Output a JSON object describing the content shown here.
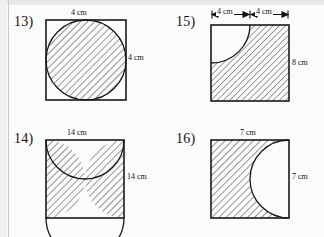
{
  "page": {
    "background_color": "#fbfbfb",
    "line_color": "#1a1a1a",
    "margin_rule_color": "#c9c9c9"
  },
  "problems": [
    {
      "number": "13)",
      "shape": "square-with-four-corner-quarter-circles",
      "shaded_region": "central-astroid-star",
      "labels": {
        "top": "4 cm",
        "right": "4 cm"
      },
      "dimension_style": "plain",
      "side_cm": 4,
      "radius_cm": 2
    },
    {
      "number": "15)",
      "shape": "square-with-quarter-circle-cut-from-top-left",
      "shaded_region": "square-minus-quarter-circle",
      "labels": {
        "top_left_segment": "4 cm",
        "top_right_segment": "4 cm",
        "right": "8 cm"
      },
      "dimension_style": "arrows",
      "side_cm": 8,
      "radius_cm": 4
    },
    {
      "number": "14)",
      "shape": "square-with-two-semicircles-top-and-bottom",
      "shaded_region": "left-and-right-side-slivers",
      "labels": {
        "top": "14 cm",
        "right": "14 cm"
      },
      "dimension_style": "plain",
      "side_cm": 14,
      "radius_cm": 7
    },
    {
      "number": "16)",
      "shape": "square-with-semicircle-cut-from-right-edge",
      "shaded_region": "square-minus-semicircle",
      "labels": {
        "top": "7 cm",
        "right": "7 cm"
      },
      "dimension_style": "plain",
      "side_cm": 7,
      "radius_cm": 3.5
    }
  ]
}
